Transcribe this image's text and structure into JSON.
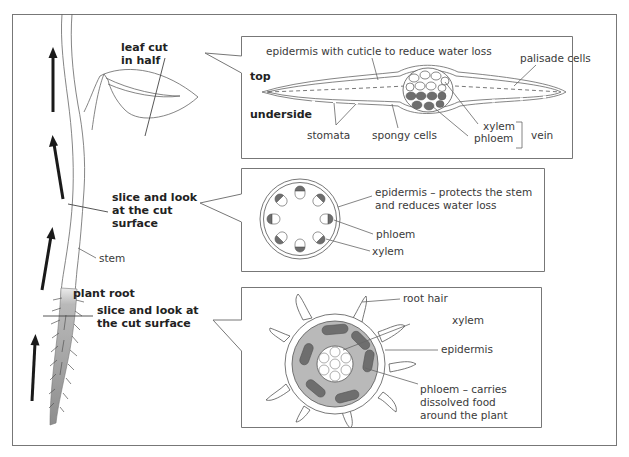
{
  "figure": {
    "frame_color": "#777777",
    "colors": {
      "dark_tissue": "#6e6e6e",
      "root_cortex": "#b9b9b9",
      "root_gradient_top": "#e2e2e2",
      "arrow": "#1a1a1a",
      "text": "#3a3a3a"
    }
  },
  "plant": {
    "labels": {
      "leaf_cut": [
        "leaf cut",
        "in half"
      ],
      "stem_slice": [
        "slice and look",
        "at the cut",
        "surface"
      ],
      "stem": "stem",
      "plant_root": "plant root",
      "root_slice": [
        "slice and look at",
        "the cut surface"
      ]
    },
    "arrows": [
      "up-arrow",
      "up-arrow",
      "up-arrow",
      "up-arrow"
    ]
  },
  "leaf_section": {
    "labels": {
      "epidermis": "epidermis with cuticle to reduce water loss",
      "palisade": "palisade cells",
      "top": "top",
      "underside": "underside",
      "stomata": "stomata",
      "spongy": "spongy cells",
      "xylem": "xylem",
      "phloem": "phloem",
      "vein": "vein"
    }
  },
  "stem_section": {
    "labels": {
      "epidermis": [
        "epidermis – protects the stem",
        "and reduces water loss"
      ],
      "phloem": "phloem",
      "xylem": "xylem"
    },
    "bundle_count": 8
  },
  "root_section": {
    "labels": {
      "root_hair": "root hair",
      "xylem": "xylem",
      "epidermis": "epidermis",
      "phloem": [
        "phloem – carries",
        "dissolved food",
        "around the plant"
      ]
    }
  }
}
